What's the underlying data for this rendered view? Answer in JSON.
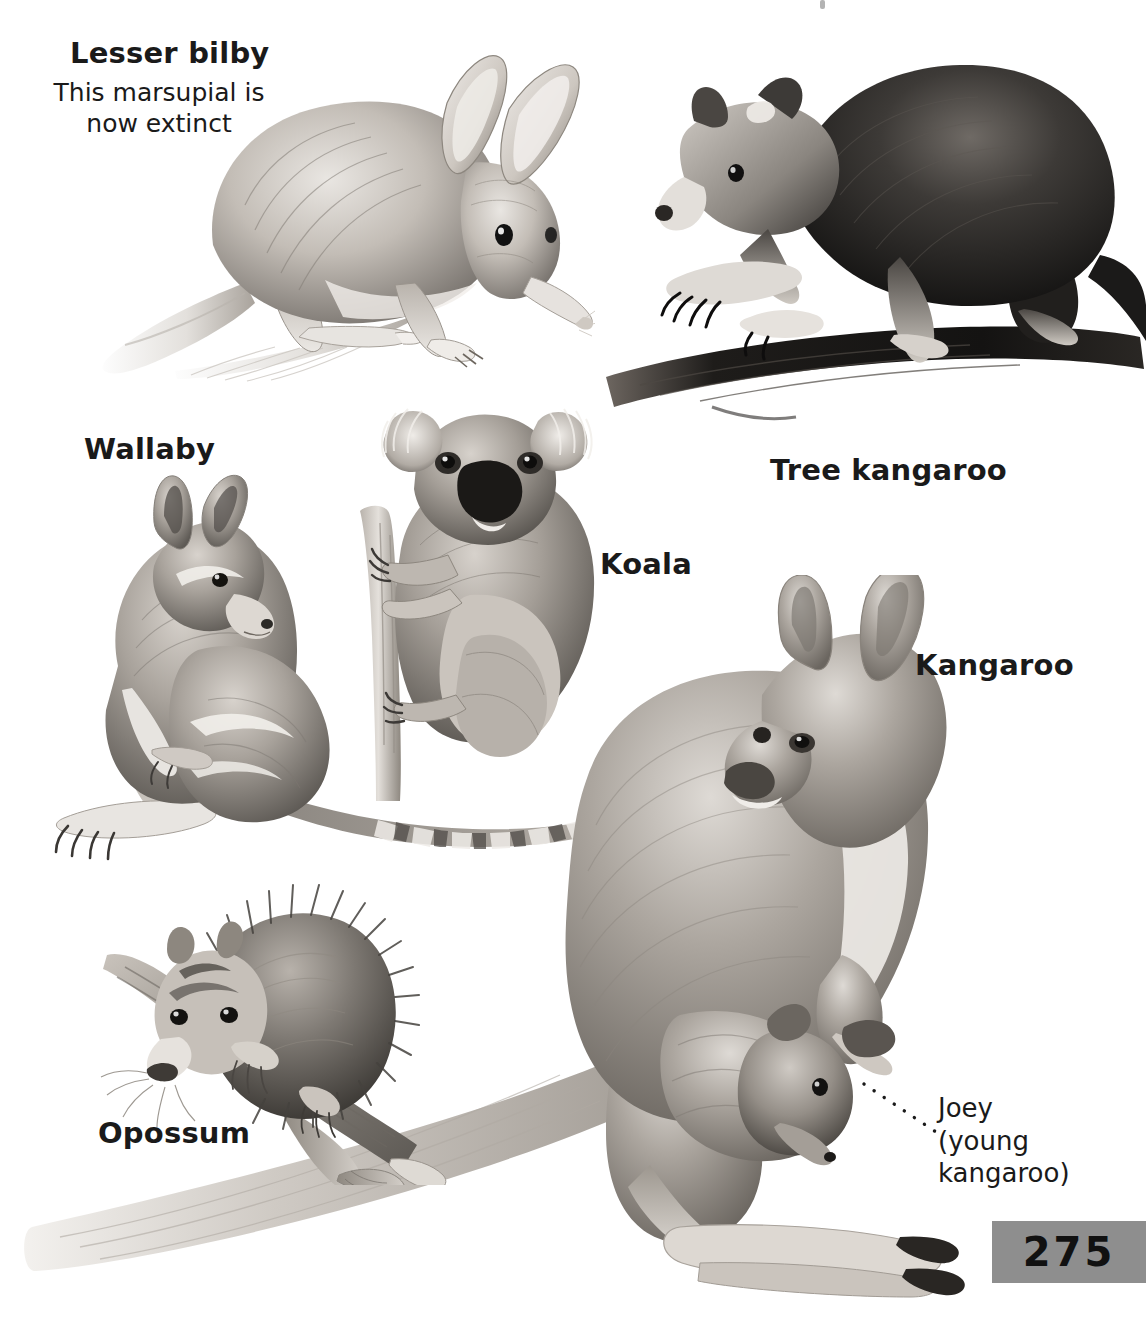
{
  "page": {
    "number": "275",
    "background_color": "#ffffff",
    "badge_color": "#8e8e8e",
    "text_color": "#1a1a1a",
    "topic": "Marsupials"
  },
  "labels": {
    "lesser_bilby": "Lesser bilby",
    "lesser_bilby_note_line1": "This marsupial is",
    "lesser_bilby_note_line2": "now extinct",
    "tree_kangaroo": "Tree kangaroo",
    "wallaby": "Wallaby",
    "koala": "Koala",
    "kangaroo": "Kangaroo",
    "opossum": "Opossum",
    "joey_callout": "Joey\n(young\nkangaroo)"
  },
  "illustrations": [
    {
      "name": "lesser-bilby",
      "caption": "Lesser bilby",
      "description": "Pencil drawing of a lesser bilby with very long ears, pointed snout and long crested tail"
    },
    {
      "name": "tree-kangaroo",
      "caption": "Tree kangaroo",
      "description": "Dark-furred tree kangaroo walking along a tree branch"
    },
    {
      "name": "wallaby",
      "caption": "Wallaby",
      "description": "Wallaby sitting upright with a ringed banded tail"
    },
    {
      "name": "koala",
      "caption": "Koala",
      "description": "Koala clinging to a vertical eucalyptus branch"
    },
    {
      "name": "kangaroo",
      "caption": "Kangaroo",
      "description": "Large kangaroo standing with a joey in its pouch and a long tail"
    },
    {
      "name": "opossum",
      "caption": "Opossum",
      "description": "Opossum on a branch with prehensile tail curled around it"
    },
    {
      "name": "joey",
      "caption": "Joey (young kangaroo)",
      "description": "Young kangaroo head emerging from the mother's pouch"
    }
  ]
}
